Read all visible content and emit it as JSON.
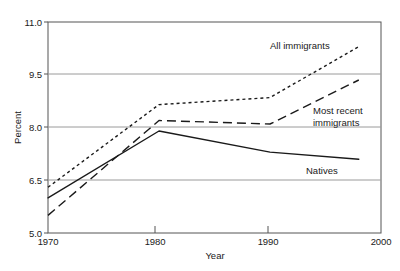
{
  "chart_data": {
    "type": "line",
    "title": "",
    "xlabel": "Year",
    "ylabel": "Percent",
    "xlim": [
      1970,
      2000
    ],
    "ylim": [
      5.0,
      11.0
    ],
    "xticks": [
      "1970",
      "1980",
      "1990",
      "2000"
    ],
    "xtick_values": [
      1970,
      1980,
      1990,
      2000
    ],
    "yticks": [
      "5.0",
      "6.5",
      "8.0",
      "9.5",
      "11.0"
    ],
    "ytick_values": [
      5.0,
      6.5,
      8.0,
      9.5,
      11.0
    ],
    "grid": "horizontal",
    "legend_position": "inline-annotations",
    "series": [
      {
        "name": "All immigrants",
        "style": "dotted",
        "x": [
          1970,
          1980,
          1990,
          1998
        ],
        "values": [
          6.3,
          8.65,
          8.85,
          10.3
        ]
      },
      {
        "name": "Most recent immigrants",
        "style": "dashed",
        "x": [
          1970,
          1980,
          1990,
          1998
        ],
        "values": [
          5.5,
          8.2,
          8.1,
          9.35
        ]
      },
      {
        "name": "Natives",
        "style": "solid",
        "x": [
          1970,
          1980,
          1990,
          1998
        ],
        "values": [
          6.0,
          7.9,
          7.3,
          7.1
        ]
      }
    ],
    "annotations": [
      {
        "text": "All immigrants",
        "series": "All immigrants"
      },
      {
        "text_line1": "Most recent",
        "text_line2": "immigrants",
        "series": "Most recent immigrants"
      },
      {
        "text": "Natives",
        "series": "Natives"
      }
    ]
  },
  "axis": {
    "y_title": "Percent",
    "x_title": "Year",
    "ytick_0": "5.0",
    "ytick_1": "6.5",
    "ytick_2": "8.0",
    "ytick_3": "9.5",
    "ytick_4": "11.0",
    "xtick_0": "1970",
    "xtick_1": "1980",
    "xtick_2": "1990",
    "xtick_3": "2000"
  },
  "labels": {
    "all_immigrants": "All immigrants",
    "most_recent_line1": "Most recent",
    "most_recent_line2": "immigrants",
    "natives": "Natives"
  },
  "colors": {
    "line": "#1a1a1a",
    "grid": "#9a9a9a",
    "axis": "#4d4d4d",
    "background": "#ffffff"
  }
}
